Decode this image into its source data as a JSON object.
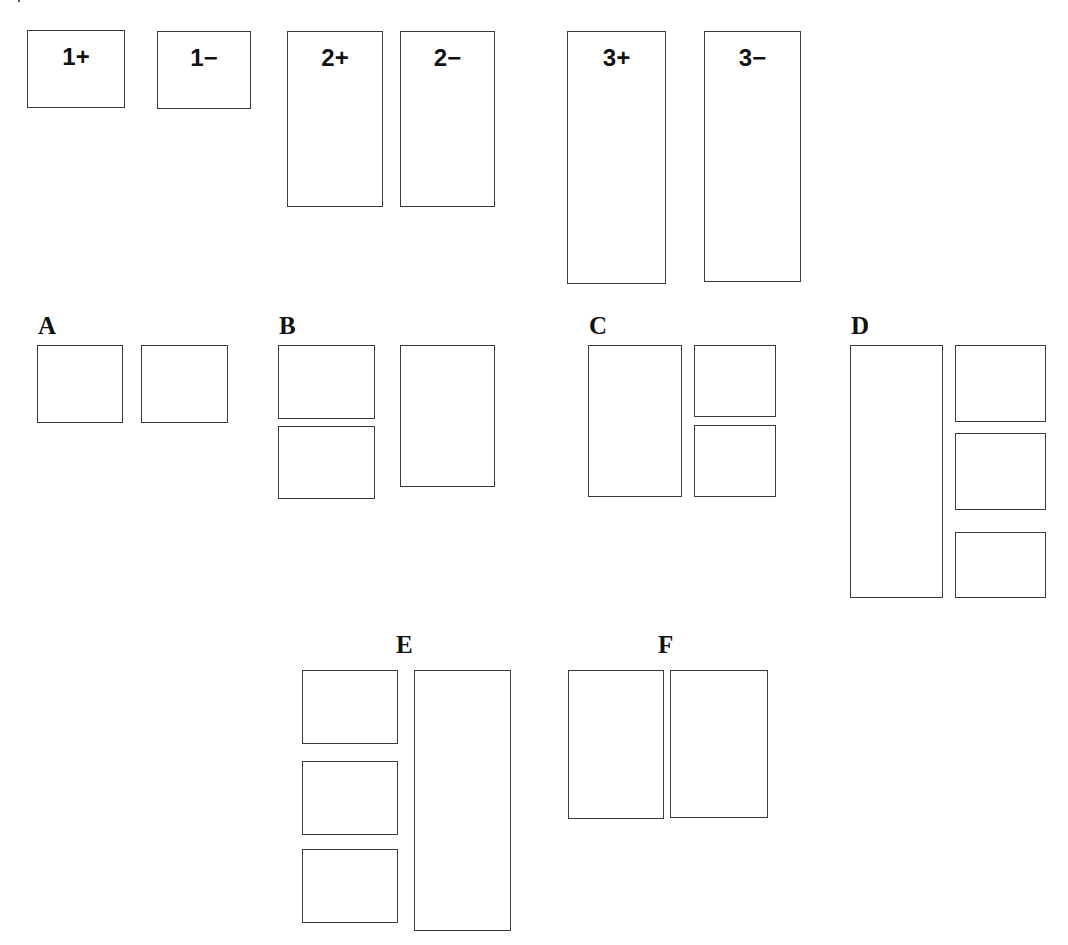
{
  "diagram": {
    "top_row": [
      {
        "id": "1+",
        "label": "1+",
        "x": 27,
        "y": 30,
        "w": 98,
        "h": 78
      },
      {
        "id": "1-",
        "label": "1−",
        "x": 157,
        "y": 31,
        "w": 94,
        "h": 78
      },
      {
        "id": "2+",
        "label": "2+",
        "x": 287,
        "y": 31,
        "w": 96,
        "h": 176
      },
      {
        "id": "2-",
        "label": "2−",
        "x": 400,
        "y": 31,
        "w": 95,
        "h": 176
      },
      {
        "id": "3+",
        "label": "3+",
        "x": 567,
        "y": 31,
        "w": 99,
        "h": 253
      },
      {
        "id": "3-",
        "label": "3−",
        "x": 704,
        "y": 31,
        "w": 97,
        "h": 251
      }
    ],
    "groups": [
      {
        "id": "A",
        "label": "A",
        "label_x": 38,
        "label_y": 313,
        "boxes": [
          {
            "x": 37,
            "y": 345,
            "w": 86,
            "h": 78
          },
          {
            "x": 141,
            "y": 345,
            "w": 87,
            "h": 78
          }
        ]
      },
      {
        "id": "B",
        "label": "B",
        "label_x": 279,
        "label_y": 313,
        "boxes": [
          {
            "x": 278,
            "y": 345,
            "w": 97,
            "h": 74
          },
          {
            "x": 278,
            "y": 426,
            "w": 97,
            "h": 73
          },
          {
            "x": 400,
            "y": 345,
            "w": 95,
            "h": 142
          }
        ]
      },
      {
        "id": "C",
        "label": "C",
        "label_x": 589,
        "label_y": 313,
        "boxes": [
          {
            "x": 588,
            "y": 345,
            "w": 94,
            "h": 152
          },
          {
            "x": 694,
            "y": 345,
            "w": 82,
            "h": 72
          },
          {
            "x": 694,
            "y": 425,
            "w": 82,
            "h": 72
          }
        ]
      },
      {
        "id": "D",
        "label": "D",
        "label_x": 851,
        "label_y": 313,
        "boxes": [
          {
            "x": 850,
            "y": 345,
            "w": 93,
            "h": 253
          },
          {
            "x": 955,
            "y": 345,
            "w": 91,
            "h": 77
          },
          {
            "x": 955,
            "y": 433,
            "w": 91,
            "h": 77
          },
          {
            "x": 955,
            "y": 532,
            "w": 91,
            "h": 66
          }
        ]
      },
      {
        "id": "E",
        "label": "E",
        "label_x": 396,
        "label_y": 632,
        "boxes": [
          {
            "x": 302,
            "y": 670,
            "w": 96,
            "h": 74
          },
          {
            "x": 302,
            "y": 761,
            "w": 96,
            "h": 74
          },
          {
            "x": 302,
            "y": 849,
            "w": 96,
            "h": 74
          },
          {
            "x": 414,
            "y": 670,
            "w": 97,
            "h": 261
          }
        ]
      },
      {
        "id": "F",
        "label": "F",
        "label_x": 658,
        "label_y": 632,
        "boxes": [
          {
            "x": 568,
            "y": 670,
            "w": 96,
            "h": 149
          },
          {
            "x": 670,
            "y": 670,
            "w": 98,
            "h": 148
          }
        ]
      }
    ],
    "colors": {
      "stroke": "#3a3a3a",
      "text": "#111111",
      "background": "#ffffff"
    }
  }
}
